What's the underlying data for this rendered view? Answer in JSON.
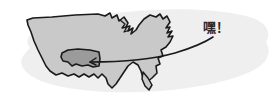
{
  "figure": {
    "kind": "annotated-map-illustration",
    "background_color": "#ffffff",
    "width": 278,
    "height": 105
  },
  "blob": {
    "name": "soft-gray-halo",
    "color": "#efefef",
    "opacity": 1
  },
  "map": {
    "region_name": "United States",
    "fill_color": "#c9c9c9",
    "outline_color": "#1a1a1a",
    "outline_width": 1.6,
    "style": "hand-drawn"
  },
  "highlight": {
    "state_name": "highlighted-state",
    "fill_color": "#9b9b9b",
    "outline_color": "#1a1a1a"
  },
  "pointer": {
    "name": "callout-leader-line",
    "color": "#1a1a1a",
    "width": 1.6,
    "from": {
      "x": 92,
      "y": 62
    },
    "to": {
      "x": 213,
      "y": 37
    }
  },
  "callout": {
    "text": "嘿！",
    "color": "#2b2b2b",
    "x": 203,
    "y": 20
  }
}
